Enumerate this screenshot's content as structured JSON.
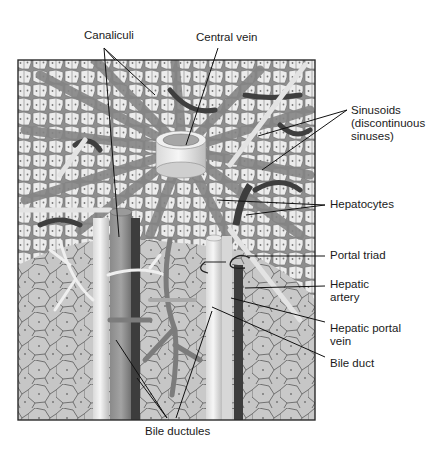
{
  "figure": {
    "colors": {
      "background": "#ffffff",
      "frame_border": "#2b2b2b",
      "cell_fill_light": "#ececec",
      "cell_border": "#5a5a5a",
      "sinusoid_fill": "#8e8e8e",
      "lower_tissue_fill": "#c6c6c6",
      "lower_tissue_border": "#4a4a4a",
      "vein_dark": "#4a4a4a",
      "vessel_mid": "#7a7a7a",
      "duct_light": "#e4e4e4",
      "leader_line": "#111111",
      "text": "#1a1a1a"
    }
  },
  "labels": {
    "canaliculi": "Canaliculi",
    "central_vein": "Central vein",
    "sinusoids": "Sinusoids (discontinuous sinuses)",
    "hepatocytes": "Hepatocytes",
    "portal_triad": "Portal triad",
    "hepatic_artery": "Hepatic artery",
    "hepatic_portal_vein": "Hepatic portal vein",
    "bile_duct": "Bile duct",
    "bile_ductules": "Bile ductules"
  }
}
